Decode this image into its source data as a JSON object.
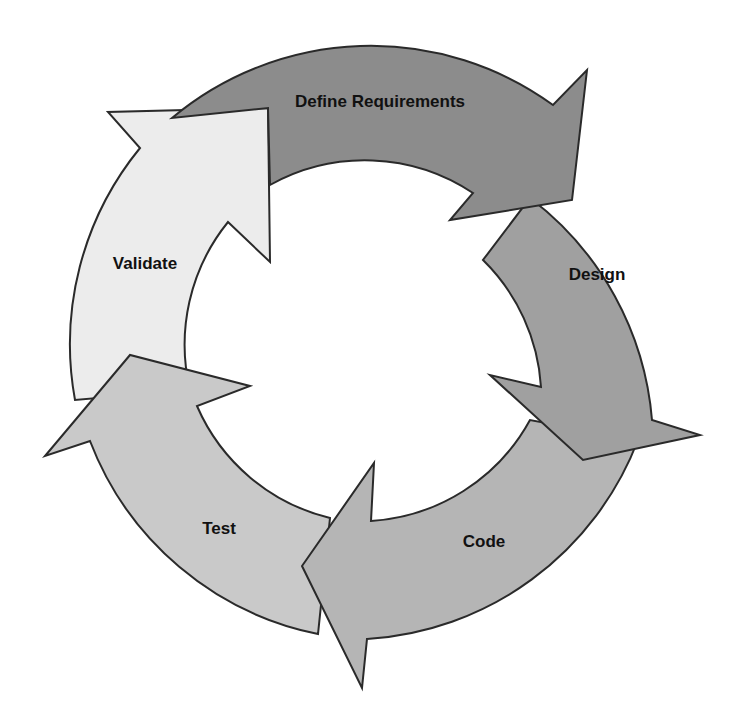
{
  "diagram": {
    "type": "cycle",
    "stages": [
      {
        "label": "Define Requirements",
        "color": "#8c8c8c",
        "label_x": 380,
        "label_y": 102
      },
      {
        "label": "Design",
        "color": "#a0a0a0",
        "label_x": 597,
        "label_y": 275
      },
      {
        "label": "Code",
        "color": "#b5b5b5",
        "label_x": 484,
        "label_y": 542
      },
      {
        "label": "Test",
        "color": "#c9c9c9",
        "label_x": 219,
        "label_y": 529
      },
      {
        "label": "Validate",
        "color": "#ececec",
        "label_x": 145,
        "label_y": 264
      }
    ],
    "flow": [
      "Define Requirements",
      "Design",
      "Code",
      "Test",
      "Validate",
      "Define Requirements"
    ]
  }
}
